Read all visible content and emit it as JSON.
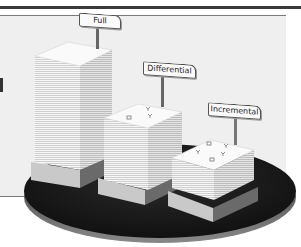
{
  "diagram": {
    "colors": {
      "platform": "#1e1e1e",
      "paper_front": "#f4f4f4",
      "paper_side": "#e2e2e2",
      "paper_top": "#fbfbfb",
      "base_front": "#c8c8c8",
      "base_side": "#6e6e6e",
      "panel": "#efefef",
      "topbar": "#3a3a3a"
    },
    "stacks": [
      {
        "label": "Full",
        "relative_height": "tall"
      },
      {
        "label": "Differential",
        "relative_height": "medium"
      },
      {
        "label": "Incremental",
        "relative_height": "short"
      }
    ]
  }
}
